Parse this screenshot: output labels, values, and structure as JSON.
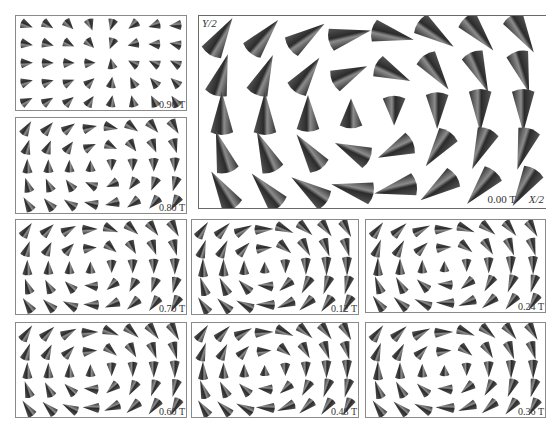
{
  "figure": {
    "cone_color": "#3a3a3a",
    "highlight_color": "#9a9a9a",
    "border_color": "#8a8a8a"
  },
  "panels": [
    {
      "id": "p090",
      "field_label": "0.90 T",
      "layout": {
        "x": 15,
        "y": 15,
        "w": 172,
        "h": 96
      },
      "rows": 5,
      "cols": 8,
      "cone_scale": 0.55,
      "core": {
        "cx": 0.55,
        "cy": 0.45
      },
      "mode": "saturated",
      "inplane": 0.35
    },
    {
      "id": "p080",
      "field_label": "0.80 T",
      "layout": {
        "x": 15,
        "y": 117,
        "w": 172,
        "h": 97
      },
      "rows": 5,
      "cols": 8,
      "cone_scale": 0.6,
      "core": {
        "cx": 0.5,
        "cy": 0.5
      },
      "mode": "partial",
      "inplane": 0.55
    },
    {
      "id": "p000",
      "field_label": "0.00 T",
      "layout": {
        "x": 198,
        "y": 15,
        "w": 348,
        "h": 194
      },
      "rows": 5,
      "cols": 8,
      "cone_scale": 1.0,
      "core": {
        "cx": 0.5,
        "cy": 0.5
      },
      "mode": "vortex",
      "inplane": 1.0,
      "axis_labels": {
        "y": "Y/2",
        "x": "X/2"
      }
    },
    {
      "id": "p070",
      "field_label": "0.70 T",
      "layout": {
        "x": 15,
        "y": 219,
        "w": 172,
        "h": 96
      },
      "rows": 5,
      "cols": 8,
      "cone_scale": 0.6,
      "core": {
        "cx": 0.45,
        "cy": 0.5
      },
      "mode": "partial",
      "inplane": 0.65
    },
    {
      "id": "p012",
      "field_label": "0.12 T",
      "layout": {
        "x": 191,
        "y": 219,
        "w": 168,
        "h": 96
      },
      "rows": 5,
      "cols": 8,
      "cone_scale": 0.6,
      "core": {
        "cx": 0.45,
        "cy": 0.5
      },
      "mode": "vortex",
      "inplane": 0.95
    },
    {
      "id": "p024",
      "field_label": "0.24 T",
      "layout": {
        "x": 365,
        "y": 219,
        "w": 181,
        "h": 94
      },
      "rows": 5,
      "cols": 8,
      "cone_scale": 0.6,
      "core": {
        "cx": 0.45,
        "cy": 0.5
      },
      "mode": "vortex",
      "inplane": 0.9
    },
    {
      "id": "p060",
      "field_label": "0.60 T",
      "layout": {
        "x": 15,
        "y": 322,
        "w": 172,
        "h": 96
      },
      "rows": 5,
      "cols": 8,
      "cone_scale": 0.6,
      "core": {
        "cx": 0.45,
        "cy": 0.5
      },
      "mode": "partial",
      "inplane": 0.75
    },
    {
      "id": "p048",
      "field_label": "0.48 T",
      "layout": {
        "x": 191,
        "y": 322,
        "w": 168,
        "h": 96
      },
      "rows": 5,
      "cols": 8,
      "cone_scale": 0.6,
      "core": {
        "cx": 0.45,
        "cy": 0.5
      },
      "mode": "vortex",
      "inplane": 0.8
    },
    {
      "id": "p036",
      "field_label": "0.36 T",
      "layout": {
        "x": 365,
        "y": 322,
        "w": 181,
        "h": 96
      },
      "rows": 5,
      "cols": 8,
      "cone_scale": 0.6,
      "core": {
        "cx": 0.45,
        "cy": 0.5
      },
      "mode": "vortex",
      "inplane": 0.85
    }
  ]
}
